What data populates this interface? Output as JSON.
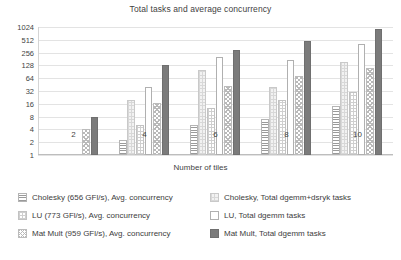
{
  "chart_data": {
    "type": "bar",
    "title": "Total tasks and average concurrency",
    "xlabel": "Number of tiles",
    "ylabel": "",
    "categories": [
      "2",
      "4",
      "6",
      "8",
      "10"
    ],
    "yscale": "log2",
    "ylim": [
      1,
      1024
    ],
    "yticks": [
      "1024",
      "512",
      "256",
      "128",
      "64",
      "32",
      "16",
      "8",
      "4",
      "2",
      "1"
    ],
    "grid": true,
    "legend_position": "bottom",
    "series": [
      {
        "name": "Cholesky (656 GFl/s), Avg. concurrency",
        "pattern": "horizontal-lines",
        "values": [
          null,
          2.2,
          5,
          7,
          14
        ]
      },
      {
        "name": "Cholesky, Total dgemm+dsryk tasks",
        "pattern": "fine-grid-gray",
        "values": [
          null,
          20,
          100,
          40,
          150
        ]
      },
      {
        "name": "LU (773 GFl/s), Avg. concurrency",
        "pattern": "fine-grid-light",
        "values": [
          null,
          5,
          13,
          20,
          30
        ]
      },
      {
        "name": "LU, Total dgemm tasks",
        "pattern": "solid-white",
        "values": [
          null,
          40,
          200,
          170,
          400
        ]
      },
      {
        "name": "Mat Mult (959 GFl/s), Avg. concurrency",
        "pattern": "cross-hatch",
        "values": [
          4,
          17,
          42,
          72,
          110
        ]
      },
      {
        "name": "Mat Mult, Total dgemm tasks",
        "pattern": "solid-dark",
        "values": [
          8,
          130,
          290,
          490,
          900
        ]
      }
    ]
  },
  "legend": {
    "left": [
      "Cholesky (656 GFl/s), Avg. concurrency",
      "LU (773 GFl/s), Avg. concurrency",
      "Mat Mult (959 GFl/s), Avg. concurrency"
    ],
    "right": [
      "Cholesky, Total dgemm+dsryk tasks",
      "LU, Total dgemm tasks",
      "Mat Mult, Total dgemm tasks"
    ]
  }
}
